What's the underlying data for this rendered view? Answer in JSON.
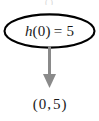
{
  "figure": {
    "background_color": "#ffffff",
    "top_artifact_text": "( )"
  },
  "callout": {
    "shape": "ellipse",
    "stroke_color": "#000000",
    "stroke_width": 2,
    "fill": "#ffffff",
    "equation": {
      "full_text": "h(0) = 5",
      "function_name": "h",
      "input_open_paren": "(",
      "input_value": "0",
      "input_close_paren": ")",
      "equals_sign": "=",
      "output_value": "5"
    }
  },
  "arrow": {
    "direction": "down",
    "color": "#8a8a8a",
    "shaft_width": 3,
    "head_width": 13
  },
  "result": {
    "full_text": "( 0 , 5 )",
    "open_paren": "(",
    "x_value": "0",
    "comma": ",",
    "y_value": "5",
    "close_paren": ")"
  }
}
